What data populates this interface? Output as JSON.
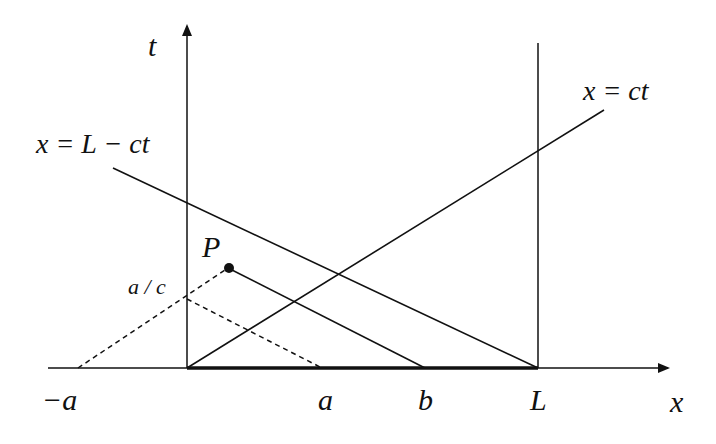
{
  "diagram": {
    "type": "spacetime-diagram",
    "axes": {
      "x_label": "x",
      "t_label": "t"
    },
    "labels": {
      "line_left": "x = L − ct",
      "line_right": "x = ct",
      "point": "P",
      "t_intercept": "a / c",
      "tick_neg_a": "−a",
      "tick_a": "a",
      "tick_b": "b",
      "tick_L": "L"
    },
    "colors": {
      "ink": "#111111",
      "background": "#ffffff"
    }
  }
}
